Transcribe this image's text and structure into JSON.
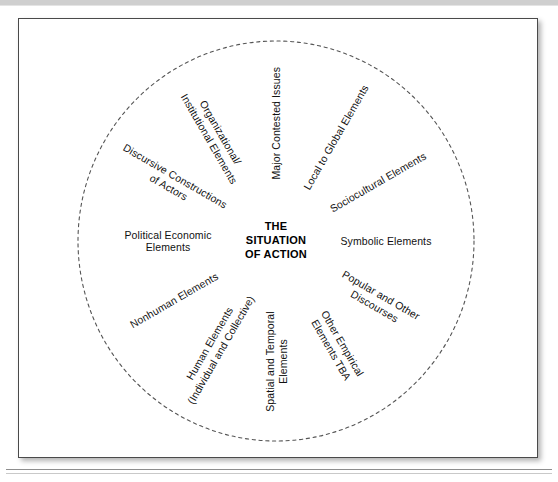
{
  "figure": {
    "type": "radial-spoke-diagram",
    "center_label": "THE\nSITUATION\nOF ACTION",
    "circle": {
      "style": "dashed",
      "color": "#555555",
      "center_x": 257,
      "center_y": 222,
      "radius_x": 198,
      "radius_y": 200
    },
    "spokes": [
      {
        "id": "major-contested-issues",
        "label": "Major Contested Issues",
        "angle_deg": -90,
        "rotation_deg": -90,
        "lines": 1
      },
      {
        "id": "local-to-global-elements",
        "label": "Local to Global Elements",
        "angle_deg": -60,
        "rotation_deg": -60,
        "lines": 1
      },
      {
        "id": "sociocultural-elements",
        "label": "Sociocultural Elements",
        "angle_deg": -30,
        "rotation_deg": -30,
        "lines": 1
      },
      {
        "id": "symbolic-elements",
        "label": "Symbolic Elements",
        "angle_deg": 0,
        "rotation_deg": 0,
        "lines": 1
      },
      {
        "id": "popular-and-other-discourses",
        "label": "Popular and Other\nDiscourses",
        "angle_deg": 30,
        "rotation_deg": 30,
        "lines": 2
      },
      {
        "id": "other-empirical-elements-tba",
        "label": "Other Empirical\nElements TBA",
        "angle_deg": 60,
        "rotation_deg": 60,
        "lines": 2
      },
      {
        "id": "spatial-and-temporal-elements",
        "label": "Spatial and Temporal\nElements",
        "angle_deg": 90,
        "rotation_deg": -90,
        "lines": 2
      },
      {
        "id": "human-elements",
        "label": "Human Elements\n(Individual and Collective)",
        "angle_deg": 120,
        "rotation_deg": -60,
        "lines": 2
      },
      {
        "id": "nonhuman-elements",
        "label": "Nonhuman Elements",
        "angle_deg": 150,
        "rotation_deg": -30,
        "lines": 1
      },
      {
        "id": "political-economic-elements",
        "label": "Political Economic\nElements",
        "angle_deg": 180,
        "rotation_deg": 0,
        "lines": 2
      },
      {
        "id": "discursive-constructions-of-actors",
        "label": "Discursive Constructions\nof Actors",
        "angle_deg": 210,
        "rotation_deg": 30,
        "lines": 2
      },
      {
        "id": "organizational-institutional-elements",
        "label": "Organizational/\nInstitutional Elements",
        "angle_deg": 240,
        "rotation_deg": 60,
        "lines": 2
      }
    ]
  }
}
